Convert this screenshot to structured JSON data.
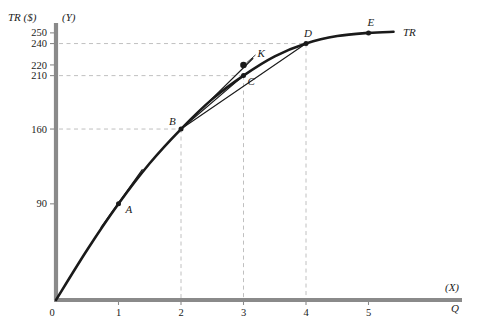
{
  "figure": {
    "y_axis_title": "TR ($)",
    "y_axis_var": "(Y)",
    "x_axis_var": "(X)",
    "x_axis_title": "Q",
    "curve_label": "TR",
    "origin_label": "0"
  },
  "y_ticks": [
    {
      "value": 250,
      "label": "250"
    },
    {
      "value": 240,
      "label": "240"
    },
    {
      "value": 220,
      "label": "220"
    },
    {
      "value": 210,
      "label": "210"
    },
    {
      "value": 160,
      "label": "160"
    },
    {
      "value": 90,
      "label": "90"
    }
  ],
  "x_ticks": [
    {
      "value": 0,
      "label": "0"
    },
    {
      "value": 1,
      "label": "1"
    },
    {
      "value": 2,
      "label": "2"
    },
    {
      "value": 3,
      "label": "3"
    },
    {
      "value": 4,
      "label": "4"
    },
    {
      "value": 5,
      "label": "5"
    }
  ],
  "points": [
    {
      "id": "A",
      "label": "A",
      "x": 1,
      "y": 90,
      "label_dx": 7,
      "label_dy": 9,
      "on_curve": true
    },
    {
      "id": "B",
      "label": "B",
      "x": 2,
      "y": 160,
      "label_dx": -12,
      "label_dy": -4,
      "on_curve": true
    },
    {
      "id": "C",
      "label": "C",
      "x": 3,
      "y": 210,
      "label_dx": 4,
      "label_dy": 9,
      "on_curve": true
    },
    {
      "id": "K",
      "label": "K",
      "x": 3,
      "y": 220,
      "label_dx": 14,
      "label_dy": -8,
      "on_curve": false
    },
    {
      "id": "D",
      "label": "D",
      "x": 4,
      "y": 240,
      "label_dx": -2,
      "label_dy": -7,
      "on_curve": true
    },
    {
      "id": "E",
      "label": "E",
      "x": 5,
      "y": 250,
      "label_dx": -1,
      "label_dy": -7,
      "on_curve": true
    }
  ],
  "chart_data": {
    "type": "line",
    "title": "",
    "xlabel": "Q",
    "ylabel": "TR ($)",
    "xlim": [
      0,
      5.6
    ],
    "ylim": [
      0,
      262
    ],
    "grid": "dashed guide lines only",
    "legend": "none",
    "series": [
      {
        "name": "TR",
        "type": "curve",
        "x": [
          0,
          0.5,
          1,
          1.5,
          2,
          2.5,
          3,
          3.5,
          4,
          4.5,
          5,
          5.4
        ],
        "y": [
          0,
          47,
          90,
          128,
          160,
          188,
          210,
          228,
          240,
          247,
          250,
          251
        ]
      },
      {
        "name": "tangent at A",
        "type": "segment",
        "x": [
          0.72,
          1.38
        ],
        "y": [
          68,
          122
        ]
      },
      {
        "name": "tangent at B (through K)",
        "type": "segment",
        "x": [
          2,
          3.15
        ],
        "y": [
          160,
          226
        ]
      },
      {
        "name": "chord B to C",
        "type": "segment",
        "x": [
          2,
          3
        ],
        "y": [
          160,
          210
        ]
      },
      {
        "name": "chord B to D",
        "type": "segment",
        "x": [
          2,
          4
        ],
        "y": [
          160,
          240
        ]
      }
    ],
    "annotations": [
      {
        "text": "A",
        "x": 1,
        "y": 90,
        "note": "point on TR at Q=1, TR=90"
      },
      {
        "text": "B",
        "x": 2,
        "y": 160,
        "note": "point on TR at Q=2, TR=160"
      },
      {
        "text": "C",
        "x": 3,
        "y": 210,
        "note": "point on TR at Q=3, TR=210"
      },
      {
        "text": "K",
        "x": 3,
        "y": 220,
        "note": "point on tangent at B extended to Q=3"
      },
      {
        "text": "D",
        "x": 4,
        "y": 240,
        "note": "point on TR at Q=4, TR=240"
      },
      {
        "text": "E",
        "x": 5,
        "y": 250,
        "note": "point on TR at Q=5, TR=250"
      },
      {
        "text": "TR",
        "x": 5.55,
        "y": 251,
        "note": "curve name label"
      }
    ],
    "hgrid_values": [
      240,
      210,
      160
    ],
    "vgrid_values": [
      2,
      3,
      4
    ],
    "colors": {
      "curve": "#1a1a1a",
      "axis": "#8a8a8a",
      "grid": "#b9b9b9",
      "text": "#1a1a1a"
    }
  }
}
